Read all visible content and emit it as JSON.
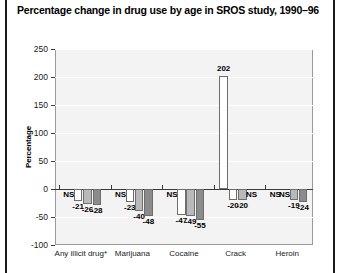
{
  "figure": {
    "title": "Percentage change in drug use by age in SROS study, 1990–96",
    "footnote_marker": "*"
  },
  "chart_data": {
    "type": "bar",
    "title": "Percentage change in drug use by age in SROS study, 1990–96",
    "xlabel": "",
    "ylabel": "Percentage",
    "ylim": [
      -100,
      250
    ],
    "yticks": [
      250,
      200,
      150,
      100,
      50,
      0,
      -50,
      -100
    ],
    "ytick_labels": [
      "250",
      "200",
      "150",
      "100",
      "50",
      "0",
      "-50",
      "-100"
    ],
    "grid": true,
    "legend": "none",
    "categories": [
      "Any illicit drug*",
      "Marijuana",
      "Cocaine",
      "Crack",
      "Heroin"
    ],
    "series": [
      {
        "name": "series-1",
        "color": "#ffffff",
        "values": [
          null,
          null,
          null,
          202,
          null
        ],
        "labels": [
          "NS",
          "NS",
          "NS",
          "202",
          "NS"
        ]
      },
      {
        "name": "series-2",
        "color": "#ffffff",
        "values": [
          -21,
          -23,
          -47,
          -20,
          null
        ],
        "labels": [
          "-21",
          "-23",
          "-47",
          "-20",
          "NS"
        ]
      },
      {
        "name": "series-3",
        "color": "#b9b9b9",
        "values": [
          -26,
          -40,
          -49,
          -20,
          -19
        ],
        "labels": [
          "-26",
          "-40",
          "-49",
          "-20",
          "-19"
        ]
      },
      {
        "name": "series-4",
        "color": "#8b8b8b",
        "values": [
          -28,
          -48,
          -55,
          null,
          -24
        ],
        "labels": [
          "-28",
          "-48",
          "-55",
          "NS",
          "-24"
        ]
      }
    ],
    "not_significant_token": "NS"
  }
}
